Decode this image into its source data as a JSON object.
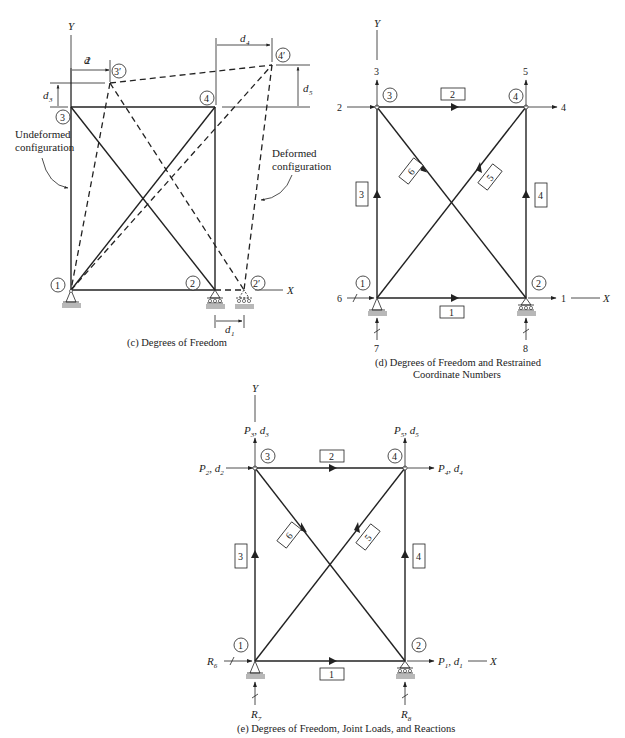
{
  "panel_c": {
    "caption": "(c) Degrees of Freedom",
    "axis_x": "X",
    "axis_y": "Y",
    "nodes": [
      "1",
      "2",
      "3",
      "4"
    ],
    "deformed_nodes": [
      "2′",
      "3′",
      "4′"
    ],
    "displacements": [
      "d1",
      "d2",
      "d3",
      "d4",
      "d5"
    ],
    "label_undeformed_1": "Undeformed",
    "label_undeformed_2": "configuration",
    "label_deformed_1": "Deformed",
    "label_deformed_2": "configuration",
    "d1": "d",
    "d1_sub": "1",
    "d2": "d",
    "d2_sub": "2",
    "d3": "d",
    "d3_sub": "3",
    "d4": "d",
    "d4_sub": "4",
    "d5": "d",
    "d5_sub": "5"
  },
  "panel_d": {
    "caption_line1": "(d) Degrees of Freedom and Restrained",
    "caption_line2": "Coordinate Numbers",
    "axis_x": "X",
    "axis_y": "Y",
    "nodes": [
      "1",
      "2",
      "3",
      "4"
    ],
    "members": [
      "1",
      "2",
      "3",
      "4",
      "5",
      "6"
    ],
    "coordinates": {
      "c1": "1",
      "c2": "2",
      "c3": "3",
      "c4": "4",
      "c5": "5",
      "c6": "6",
      "c7": "7",
      "c8": "8"
    }
  },
  "panel_e": {
    "caption": "(e) Degrees of Freedom, Joint Loads, and Reactions",
    "axis_x": "X",
    "axis_y": "Y",
    "nodes": [
      "1",
      "2",
      "3",
      "4"
    ],
    "members": [
      "1",
      "2",
      "3",
      "4",
      "5",
      "6"
    ],
    "loads": {
      "P1": "P",
      "P1_sub": "1",
      "d1": "d",
      "d1_sub": "1",
      "P2": "P",
      "P2_sub": "2",
      "d2": "d",
      "d2_sub": "2",
      "P3": "P",
      "P3_sub": "3",
      "d3": "d",
      "d3_sub": "3",
      "P4": "P",
      "P4_sub": "4",
      "d4": "d",
      "d4_sub": "4",
      "P5": "P",
      "P5_sub": "5",
      "d5": "d",
      "d5_sub": "5"
    },
    "reactions": {
      "R6": "R",
      "R6_sub": "6",
      "R7": "R",
      "R7_sub": "7",
      "R8": "R",
      "R8_sub": "8"
    }
  }
}
